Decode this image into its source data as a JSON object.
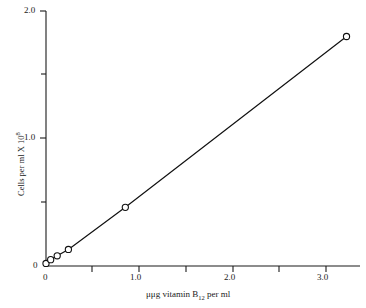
{
  "chart_data": {
    "type": "line",
    "title": "",
    "xlabel_parts": {
      "prefix": "μμg vitamin B",
      "sub": "12",
      "suffix": " per ml"
    },
    "xlabel": "μμg vitamin B12 per ml",
    "ylabel_parts": {
      "prefix": "Cells per ml X 10",
      "sup": "8"
    },
    "ylabel": "Cells per ml X 10^8",
    "xlim": [
      0,
      3.43
    ],
    "ylim": [
      0,
      2.0
    ],
    "xticks": [
      0,
      0.5,
      1.0,
      1.5,
      2.0,
      2.5,
      3.0
    ],
    "xtick_labels": [
      "0",
      "",
      "1.0",
      "",
      "2.0",
      "",
      "3.0"
    ],
    "yticks": [
      0,
      0.5,
      1.0,
      1.5,
      2.0
    ],
    "ytick_labels": [
      "0",
      "",
      "1.0",
      "",
      "2.0"
    ],
    "grid": false,
    "legend": "none",
    "marker": "open-circle",
    "series": [
      {
        "name": "vitamin B12 standard curve",
        "x": [
          0.0,
          0.05,
          0.12,
          0.24,
          0.85,
          3.22
        ],
        "y": [
          0.02,
          0.05,
          0.08,
          0.13,
          0.46,
          1.8
        ]
      }
    ]
  },
  "axes": {
    "y_top_label": "2.0",
    "y_mid_label": "1.0",
    "y_zero_label": "0",
    "x_zero_label": "0",
    "x_one_label": "1.0",
    "x_two_label": "2.0",
    "x_three_label": "3.0"
  }
}
